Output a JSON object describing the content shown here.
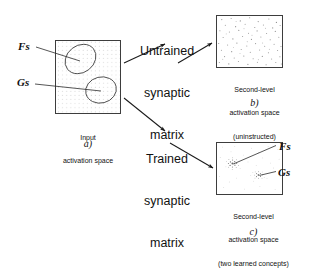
{
  "figure": {
    "panels": {
      "a": {
        "id": "a)",
        "caption_line1": "Input",
        "caption_line2": "activation space",
        "region_labels": [
          {
            "name": "Fs",
            "text": "Fs"
          },
          {
            "name": "Gs",
            "text": "Gs"
          }
        ]
      },
      "b": {
        "id": "b)",
        "caption_line1": "Second-level",
        "caption_line2": "activation space",
        "caption_line3": "(uninstructed)"
      },
      "c": {
        "id": "c)",
        "caption_line1": "Second-level",
        "caption_line2": "activation space",
        "caption_line3": "(two learned concepts)",
        "cluster_labels": [
          {
            "name": "Fs",
            "text": "Fs"
          },
          {
            "name": "Gs",
            "text": "Gs"
          }
        ]
      }
    },
    "processes": {
      "untrained": {
        "line1": "Untrained",
        "line2": "synaptic",
        "line3": "matrix"
      },
      "trained": {
        "line1": "Trained",
        "line2": "synaptic",
        "line3": "matrix"
      }
    },
    "colors": {
      "ink": "#1a1a1a",
      "box_stroke": "#3a3a3a",
      "grid_dot": "#b9b9b9",
      "speckle": "#8d8d8d",
      "cluster": "#6e6e6e",
      "background": "#ffffff"
    }
  }
}
